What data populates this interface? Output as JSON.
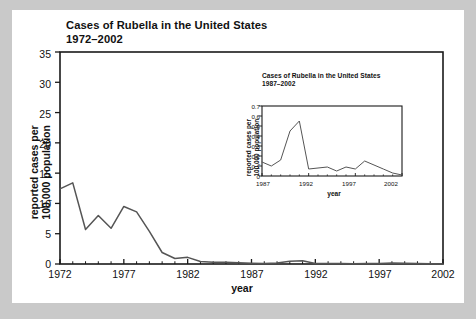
{
  "figure": {
    "background_color": "#c9c9c9",
    "panel_color": "#ffffff",
    "line_color": "#555555",
    "axis_color": "#1a1a1a"
  },
  "main_chart": {
    "title_line1": "Cases of Rubella in the United States",
    "title_line2": "1972–2002",
    "xlabel": "year",
    "ylabel_line1": "reported cases per",
    "ylabel_line2": "100,000 population",
    "ytick_labels": [
      "0",
      "5",
      "10",
      "15",
      "20",
      "25",
      "30",
      "35"
    ],
    "xtick_labels": [
      "1972",
      "1977",
      "1982",
      "1987",
      "1992",
      "1997",
      "2002"
    ]
  },
  "inset_chart": {
    "title_line1": "Cases of Rubella in the United States",
    "title_line2": "1987–2002",
    "xlabel": "year",
    "ylabel_line1": "reported cases per",
    "ylabel_line2": "100,000 population",
    "ytick_labels": [
      "0",
      "0.1",
      "0.2",
      "0.3",
      "0.4",
      "0.5",
      "0.6",
      "0.7"
    ],
    "xtick_labels": [
      "1987",
      "1992",
      "1997",
      "2002"
    ]
  },
  "chart_data": [
    {
      "type": "line",
      "id": "main",
      "title": "Cases of Rubella in the United States 1972–2002",
      "xlabel": "year",
      "ylabel": "reported cases per 100,000 population",
      "xlim": [
        1972,
        2002
      ],
      "ylim": [
        0,
        35
      ],
      "ytick_values": [
        0,
        5,
        10,
        15,
        20,
        25,
        30,
        35
      ],
      "xtick_values": [
        1972,
        1977,
        1982,
        1987,
        1992,
        1997,
        2002
      ],
      "minor_xticks": "every 1 year",
      "grid": false,
      "legend": "none",
      "x": [
        1972,
        1973,
        1974,
        1975,
        1976,
        1977,
        1978,
        1979,
        1980,
        1981,
        1982,
        1983,
        1984,
        1985,
        1986,
        1987,
        1988,
        1989,
        1990,
        1991,
        1992,
        1993,
        1994,
        1995,
        1996,
        1997,
        1998,
        1999,
        2000,
        2001,
        2002
      ],
      "values": [
        12.4,
        13.4,
        5.7,
        8.0,
        5.9,
        9.5,
        8.6,
        5.4,
        1.9,
        0.9,
        1.1,
        0.4,
        0.3,
        0.3,
        0.2,
        0.14,
        0.1,
        0.16,
        0.45,
        0.55,
        0.07,
        0.08,
        0.09,
        0.05,
        0.09,
        0.07,
        0.15,
        0.11,
        0.07,
        0.03,
        0.01
      ]
    },
    {
      "type": "line",
      "id": "inset",
      "title": "Cases of Rubella in the United States 1987–2002",
      "xlabel": "year",
      "ylabel": "reported cases per 100,000 population",
      "xlim": [
        1987,
        2002
      ],
      "ylim": [
        0,
        0.7
      ],
      "ytick_values": [
        0,
        0.1,
        0.2,
        0.3,
        0.4,
        0.5,
        0.6,
        0.7
      ],
      "xtick_values": [
        1987,
        1992,
        1997,
        2002
      ],
      "minor_xticks": "every 1 year",
      "grid": false,
      "legend": "none",
      "x": [
        1987,
        1988,
        1989,
        1990,
        1991,
        1992,
        1993,
        1994,
        1995,
        1996,
        1997,
        1998,
        1999,
        2000,
        2001,
        2002
      ],
      "values": [
        0.14,
        0.1,
        0.16,
        0.45,
        0.55,
        0.07,
        0.08,
        0.09,
        0.05,
        0.09,
        0.07,
        0.15,
        0.11,
        0.07,
        0.03,
        0.01
      ]
    }
  ]
}
